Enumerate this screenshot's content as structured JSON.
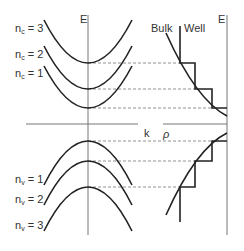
{
  "diagram": {
    "type": "band-structure-quantum-well",
    "colors": {
      "curve": "#222222",
      "axis": "#777777",
      "dashed": "#777777",
      "background": "#ffffff"
    },
    "left_panel": {
      "axis_label_vertical": "E",
      "axis_label_horizontal": "k",
      "conduction_subbands": [
        {
          "label_base": "n",
          "label_sub": "c",
          "label_rest": " = 3"
        },
        {
          "label_base": "n",
          "label_sub": "c",
          "label_rest": " = 2"
        },
        {
          "label_base": "n",
          "label_sub": "c",
          "label_rest": " = 1"
        }
      ],
      "valence_subbands": [
        {
          "label_base": "n",
          "label_sub": "v",
          "label_rest": " = 1"
        },
        {
          "label_base": "n",
          "label_sub": "v",
          "label_rest": " = 2"
        },
        {
          "label_base": "n",
          "label_sub": "v",
          "label_rest": " = 3"
        }
      ]
    },
    "right_panel": {
      "axis_label_vertical": "E",
      "axis_label_horizontal": "ρ",
      "curve_labels": {
        "bulk": "Bulk",
        "well": "Well"
      }
    }
  }
}
